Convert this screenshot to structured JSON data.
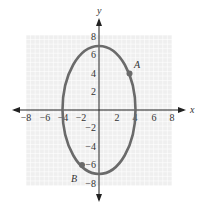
{
  "chart_data": {
    "type": "line",
    "title": "",
    "xlabel": "x",
    "ylabel": "y",
    "xlim": [
      -8,
      8
    ],
    "ylim": [
      -8,
      8
    ],
    "grid": true,
    "x_ticks": [
      "−8",
      "−6",
      "−4",
      "−2",
      "2",
      "4",
      "6",
      "8"
    ],
    "y_ticks": [
      "8",
      "6",
      "4",
      "2",
      "−2",
      "−4",
      "−6",
      "−8"
    ],
    "curve": {
      "shape": "ellipse",
      "center": [
        0,
        0
      ],
      "semi_axis_x": 4,
      "semi_axis_y": 7,
      "equation": "x^2/16 + y^2/49 = 1"
    },
    "points": [
      {
        "label": "A",
        "x": 3.3,
        "y": 4
      },
      {
        "label": "B",
        "x": -2.3,
        "y": -6
      }
    ],
    "colors": {
      "curve": "#666666",
      "grid": "#e6e6e6",
      "grid_bg": "#eeeeee",
      "axes": "#222222"
    }
  }
}
